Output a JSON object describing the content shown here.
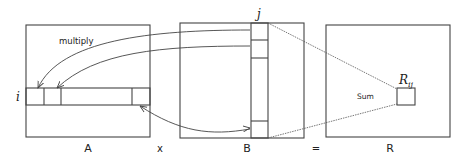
{
  "diagram": {
    "matrices": [
      {
        "id": "A",
        "label": "A"
      },
      {
        "id": "B",
        "label": "B"
      },
      {
        "id": "R",
        "label": "R"
      }
    ],
    "operators": {
      "times": "x",
      "equals": "="
    },
    "row_index": "i",
    "col_index": "j",
    "result_cell": {
      "base": "R",
      "subscript": "ij"
    },
    "annotations": {
      "multiply": "multiply",
      "sum": "Sum"
    },
    "colors": {
      "stroke": "#444444",
      "background": "#ffffff"
    }
  }
}
